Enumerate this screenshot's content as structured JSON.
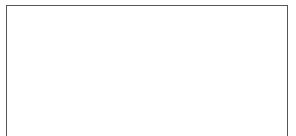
{
  "diagram": {
    "top_row": {
      "count": 5,
      "shape": "drop-pointing-down",
      "filled_half": "top",
      "centers_x": [
        75,
        110,
        144,
        179,
        213
      ]
    },
    "number_line": {
      "start_x": 53,
      "end_x": 238,
      "tick_count": 10,
      "tick_positions_x": [
        53,
        73,
        92,
        112,
        131,
        151,
        170,
        190,
        209,
        228
      ],
      "labels": []
    },
    "bottom_row": {
      "count": 5,
      "shape": "drop-pointing-up",
      "filled_half": "bottom",
      "centers_x": [
        75,
        110,
        144,
        179,
        213
      ]
    },
    "colors": {
      "ink": "#111111",
      "frame": "#555555",
      "background": "#ffffff"
    }
  }
}
